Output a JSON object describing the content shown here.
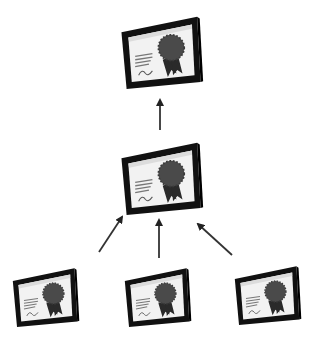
{
  "diagram": {
    "type": "certificate-chain-hierarchy",
    "colors": {
      "background": "#ffffff",
      "frame": "#111111",
      "paper": "#f2f2f2",
      "seal": "#4a4a4a",
      "arrow": "#333333"
    },
    "nodes": [
      {
        "id": "root",
        "label": "",
        "icon": "certificate-icon",
        "x": 118,
        "y": 12,
        "w": 86,
        "h": 80
      },
      {
        "id": "intermediate",
        "label": "",
        "icon": "certificate-icon",
        "x": 118,
        "y": 138,
        "w": 86,
        "h": 80
      },
      {
        "id": "leaf-1",
        "label": "",
        "icon": "certificate-icon",
        "x": 10,
        "y": 262,
        "w": 70,
        "h": 70
      },
      {
        "id": "leaf-2",
        "label": "",
        "icon": "certificate-icon",
        "x": 122,
        "y": 262,
        "w": 70,
        "h": 70
      },
      {
        "id": "leaf-3",
        "label": "",
        "icon": "certificate-icon",
        "x": 232,
        "y": 260,
        "w": 70,
        "h": 70
      }
    ],
    "edges": [
      {
        "from": "intermediate",
        "to": "root"
      },
      {
        "from": "leaf-1",
        "to": "intermediate"
      },
      {
        "from": "leaf-2",
        "to": "intermediate"
      },
      {
        "from": "leaf-3",
        "to": "intermediate"
      }
    ]
  }
}
